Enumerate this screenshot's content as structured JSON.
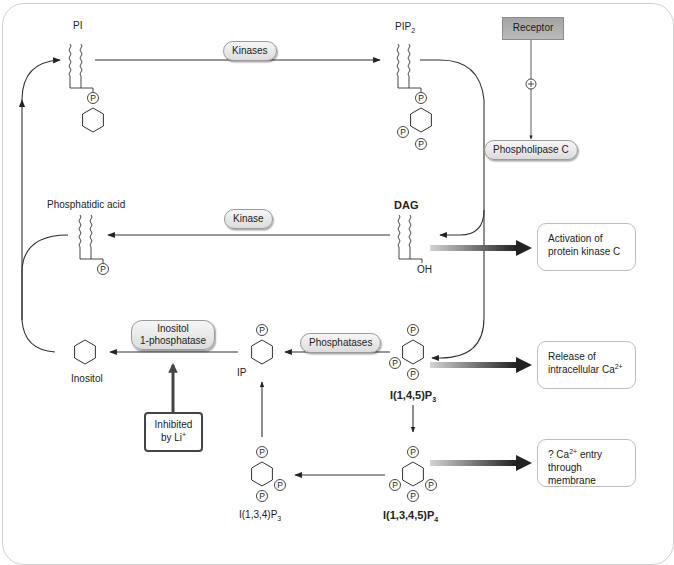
{
  "diagram": {
    "molecules": {
      "pi": {
        "label": "PI"
      },
      "pip2": {
        "label": "PIP",
        "sub": "2"
      },
      "dag": {
        "label": "DAG",
        "oh": "OH"
      },
      "phosphatidic_acid": {
        "label": "Phosphatidic acid"
      },
      "inositol": {
        "label": "Inositol"
      },
      "ip": {
        "label": "IP"
      },
      "ip3_145": {
        "label": "I(1,4,5)P",
        "sub": "3"
      },
      "ip3_134": {
        "label": "I(1,3,4)P",
        "sub": "3"
      },
      "ip4": {
        "label": "I(1,3,4,5)P",
        "sub": "4"
      },
      "phosphate_symbol": "P"
    },
    "enzymes": {
      "kinases": "Kinases",
      "kinase": "Kinase",
      "phospholipase_c": "Phospholipase C",
      "phosphatases": "Phosphatases",
      "inositol_phosphatase_line1": "Inositol",
      "inositol_phosphatase_line2": "1-phosphatase"
    },
    "receptor": {
      "label": "Receptor",
      "stimulation_symbol": "+"
    },
    "inhibition": {
      "line1": "Inhibited",
      "line2": "by Li",
      "sup": "+"
    },
    "effects": {
      "pkc": {
        "line1": "Activation of",
        "line2": "protein kinase C"
      },
      "ca_release": {
        "line1": "Release of",
        "line2": "intracellular Ca",
        "sup": "2+"
      },
      "ca_entry": {
        "line1_prefix": "? Ca",
        "sup": "2+",
        "line1_suffix": " entry",
        "line2": "through membrane"
      }
    },
    "colors": {
      "line": "#333333",
      "frame": "#cfcfcf",
      "receptor_fill": "#a9a9a9",
      "pill_fill": "#e6e6e6",
      "gradient_arrow_start": "#d0d0d0",
      "gradient_arrow_end": "#222222"
    }
  }
}
